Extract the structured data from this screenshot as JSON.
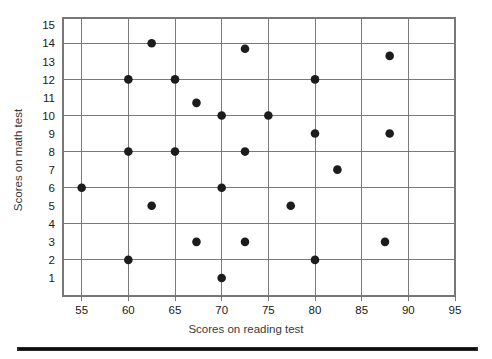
{
  "chart_data": {
    "type": "scatter",
    "title": "",
    "xlabel": "Scores on reading test",
    "ylabel": "Scores on math test",
    "xlim": [
      53,
      95
    ],
    "ylim": [
      0,
      15.4
    ],
    "grid": true,
    "legend": "none",
    "x_ticks": [
      55,
      60,
      65,
      70,
      75,
      80,
      85,
      90,
      95
    ],
    "y_ticks": [
      1,
      2,
      3,
      4,
      5,
      6,
      7,
      8,
      9,
      10,
      11,
      12,
      13,
      14,
      15
    ],
    "x_gridlines": [
      55,
      60,
      65,
      70,
      75,
      80,
      85,
      90
    ],
    "y_gridlines": [
      2,
      4,
      6,
      8,
      10,
      12,
      14
    ],
    "marker": "filled-circle",
    "marker_color": "#1c1c1c",
    "marker_size": 4.3,
    "n_points": 24,
    "points": [
      {
        "x": 55.0,
        "y": 6
      },
      {
        "x": 60.0,
        "y": 12
      },
      {
        "x": 60.0,
        "y": 8
      },
      {
        "x": 60.0,
        "y": 2
      },
      {
        "x": 62.5,
        "y": 14
      },
      {
        "x": 62.5,
        "y": 5
      },
      {
        "x": 65.0,
        "y": 12
      },
      {
        "x": 65.0,
        "y": 8
      },
      {
        "x": 67.3,
        "y": 10.7
      },
      {
        "x": 67.3,
        "y": 3
      },
      {
        "x": 70.0,
        "y": 10
      },
      {
        "x": 70.0,
        "y": 6
      },
      {
        "x": 70.0,
        "y": 1
      },
      {
        "x": 72.5,
        "y": 13.7
      },
      {
        "x": 72.5,
        "y": 8
      },
      {
        "x": 72.5,
        "y": 3
      },
      {
        "x": 75.0,
        "y": 10
      },
      {
        "x": 77.4,
        "y": 5
      },
      {
        "x": 80.0,
        "y": 12
      },
      {
        "x": 80.0,
        "y": 9
      },
      {
        "x": 80.0,
        "y": 2
      },
      {
        "x": 82.4,
        "y": 7
      },
      {
        "x": 88.0,
        "y": 13.3
      },
      {
        "x": 88.0,
        "y": 9
      },
      {
        "x": 87.5,
        "y": 3
      }
    ]
  },
  "axes": {
    "x_tick_labels": [
      "55",
      "60",
      "65",
      "70",
      "75",
      "80",
      "85",
      "90",
      "95"
    ],
    "y_tick_labels": [
      "1",
      "2",
      "3",
      "4",
      "5",
      "6",
      "7",
      "8",
      "9",
      "10",
      "11",
      "12",
      "13",
      "14",
      "15"
    ],
    "x_axis_title": "Scores on reading test",
    "y_axis_title": "Scores on math test"
  },
  "style": {
    "background": "#ffffff",
    "grid_color": "#6b6b6b",
    "frame_color": "#777777",
    "point_color": "#1c1c1c",
    "text_color": "#1a1a1a",
    "rule_color": "#0d0d0d"
  }
}
